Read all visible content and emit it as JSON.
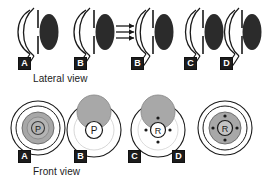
{
  "figure": {
    "background_color": "#ffffff",
    "stroke_color": "#1a1a1a",
    "lens_fill": "#2b2b2b",
    "gray_fill": "#a8a8a8",
    "gray_fill_light": "#c4c4c4",
    "rows": [
      {
        "id": "lateral",
        "caption": "Lateral view",
        "caption_x": 33,
        "caption_y": 73,
        "panels": [
          {
            "tag": "A",
            "tag_x": 18,
            "tag_y": 57,
            "center_x": 44,
            "center_y": 32,
            "has_rays": false,
            "lens_shift": 0
          },
          {
            "tag": "B",
            "tag_x": 74,
            "tag_y": 57,
            "center_x": 100,
            "center_y": 32,
            "has_rays": false,
            "lens_shift": 0
          },
          {
            "tag": "B",
            "tag_x": 131,
            "tag_y": 57,
            "center_x": 160,
            "center_y": 32,
            "has_rays": true,
            "lens_shift": 0
          },
          {
            "tag": "C",
            "tag_x": 184,
            "tag_y": 57,
            "center_x": 206,
            "center_y": 32,
            "has_rays": false,
            "lens_shift": 0
          },
          {
            "tag": "D",
            "tag_x": 220,
            "tag_y": 57,
            "center_x": 243,
            "center_y": 32,
            "has_rays": false,
            "lens_shift": 0
          }
        ]
      },
      {
        "id": "front",
        "caption": "Front view",
        "caption_x": 33,
        "caption_y": 166,
        "panels": [
          {
            "tag": "A",
            "tag_x": 18,
            "tag_y": 150,
            "center_x": 38,
            "center_y": 128,
            "center_letter": "P",
            "iris_filled": true,
            "has_blob": false,
            "has_dots": false
          },
          {
            "tag": "B",
            "tag_x": 74,
            "tag_y": 150,
            "center_x": 94,
            "center_y": 130,
            "center_letter": "P",
            "iris_filled": false,
            "has_blob": true,
            "has_dots": false
          },
          {
            "tag": "C",
            "tag_x": 128,
            "tag_y": 150,
            "center_x": 158,
            "center_y": 130,
            "center_letter": "R",
            "iris_filled": false,
            "has_blob": true,
            "has_dots": true
          },
          {
            "tag": "D",
            "tag_x": 172,
            "tag_y": 150,
            "center_x": 225,
            "center_y": 128,
            "center_letter": "R",
            "iris_filled": true,
            "has_blob": false,
            "has_dots": true
          }
        ]
      }
    ],
    "ray_count": 3,
    "labels": {
      "pupil_letter": "P",
      "lens_letter": "R"
    }
  }
}
